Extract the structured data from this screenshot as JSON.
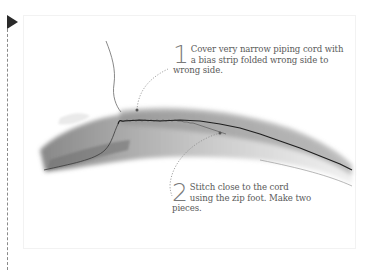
{
  "figure": {
    "steps": [
      {
        "number": "1",
        "text": "Cover very narrow piping cord with a bias strip folded wrong side to wrong side."
      },
      {
        "number": "2",
        "text": "Stitch close to the cord using the zip foot. Make two pieces."
      }
    ]
  },
  "colors": {
    "marker": "#2a2a2a",
    "text": "#5a5a5a",
    "number": "#7a7a7a",
    "leader": "#8a8a8a"
  }
}
